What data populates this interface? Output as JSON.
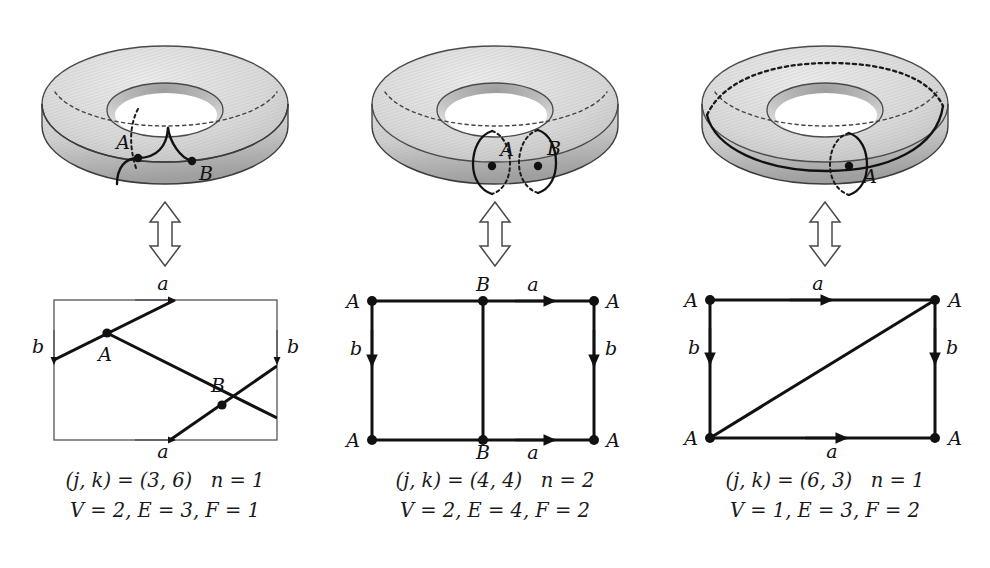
{
  "figure": {
    "background": "#ffffff",
    "ink": "#111111",
    "torus_fill_light": "#e2e2e2",
    "torus_fill_mid": "#c9c9c9",
    "torus_fill_dark": "#a8a8a8",
    "torus_outline": "#4a4a4a",
    "hatch_color": "#b4b4b4"
  },
  "panels": [
    {
      "id": "panel-1",
      "torus": {
        "name": "torus-3-6",
        "points": [
          {
            "label": "A",
            "x": 113,
            "y": 150
          },
          {
            "label": "B",
            "x": 167,
            "y": 153
          }
        ],
        "curve_kind": "diagonal-arc"
      },
      "arrow": {
        "name": "double-arrow-vertical",
        "glyph": "updown-arrow"
      },
      "square": {
        "name": "fundamental-square-3-6",
        "border_weight": "thin",
        "edge_labels": {
          "top": "a",
          "bottom": "a",
          "left": "b",
          "right": "b"
        },
        "vertices": [
          {
            "label": "A",
            "x": 107,
            "y": 341
          },
          {
            "label": "B",
            "x": 222,
            "y": 407
          }
        ],
        "interior_lines": 3
      },
      "caption": {
        "line1": "(j, k) = (3, 6)   n = 1",
        "line2": "V = 2, E = 3, F = 1",
        "j": 3,
        "k": 6,
        "n": 1,
        "V": 2,
        "E": 3,
        "F": 1
      }
    },
    {
      "id": "panel-2",
      "torus": {
        "name": "torus-4-4",
        "points": [
          {
            "label": "A",
            "x": 137,
            "y": 158
          },
          {
            "label": "B",
            "x": 183,
            "y": 158
          }
        ],
        "curve_kind": "two-meridians"
      },
      "arrow": {
        "name": "double-arrow-vertical",
        "glyph": "updown-arrow"
      },
      "square": {
        "name": "fundamental-square-4-4",
        "border_weight": "thick",
        "edge_labels": {
          "top": "a",
          "bottom": "a",
          "left": "b",
          "right": "b"
        },
        "corner_labels": {
          "top_left": "A",
          "top_right": "A",
          "bottom_left": "A",
          "bottom_right": "A"
        },
        "midpoint_labels": {
          "top": "B",
          "bottom": "B"
        },
        "interior_lines": 1
      },
      "caption": {
        "line1": "(j, k) = (4, 4)   n = 2",
        "line2": "V = 2, E = 4, F = 2",
        "j": 4,
        "k": 4,
        "n": 2,
        "V": 2,
        "E": 4,
        "F": 2
      }
    },
    {
      "id": "panel-3",
      "torus": {
        "name": "torus-6-3",
        "points": [
          {
            "label": "A",
            "x": 164,
            "y": 158
          }
        ],
        "curve_kind": "longitude-and-meridian"
      },
      "arrow": {
        "name": "double-arrow-vertical",
        "glyph": "updown-arrow"
      },
      "square": {
        "name": "fundamental-square-6-3",
        "border_weight": "thick",
        "edge_labels": {
          "top": "a",
          "bottom": "a",
          "left": "b",
          "right": "b"
        },
        "corner_labels": {
          "top_left": "A",
          "top_right": "A",
          "bottom_left": "A",
          "bottom_right": "A"
        },
        "interior_lines": 1
      },
      "caption": {
        "line1": "(j, k) = (6, 3)   n = 1",
        "line2": "V = 1, E = 3, F = 2",
        "j": 6,
        "k": 3,
        "n": 1,
        "V": 1,
        "E": 3,
        "F": 2
      }
    }
  ]
}
